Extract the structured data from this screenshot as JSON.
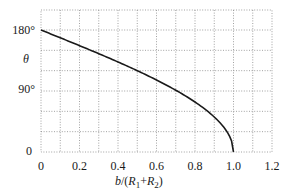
{
  "chart_data": {
    "type": "line",
    "title": "",
    "xlabel": "b/(R1+R2)",
    "ylabel": "θ",
    "xlim": [
      0,
      1.2
    ],
    "ylim": [
      0,
      180
    ],
    "grid": true,
    "legend": null,
    "x_ticks": [
      "0",
      "0.2",
      "0.4",
      "0.6",
      "0.8",
      "1.0",
      "1.2"
    ],
    "y_ticks": [
      "0",
      "90°",
      "180°"
    ],
    "series": [
      {
        "name": "theta",
        "x": [
          0,
          0.1,
          0.2,
          0.3,
          0.4,
          0.5,
          0.6,
          0.7,
          0.8,
          0.9,
          0.95,
          1.0
        ],
        "values": [
          180,
          168.5,
          156.9,
          145.1,
          132.8,
          120.0,
          106.3,
          91.1,
          73.7,
          51.7,
          36.4,
          0
        ]
      }
    ]
  },
  "labels": {
    "y_180": "180°",
    "y_90": "90°",
    "y_0": "0",
    "y_axis_symbol": "θ",
    "x_axis_b": "b",
    "x_axis_rest": "/(",
    "x_axis_R1": "R",
    "x_axis_sub1": "1",
    "x_axis_plus": "+",
    "x_axis_R2": "R",
    "x_axis_sub2": "2",
    "x_axis_close": ")"
  }
}
